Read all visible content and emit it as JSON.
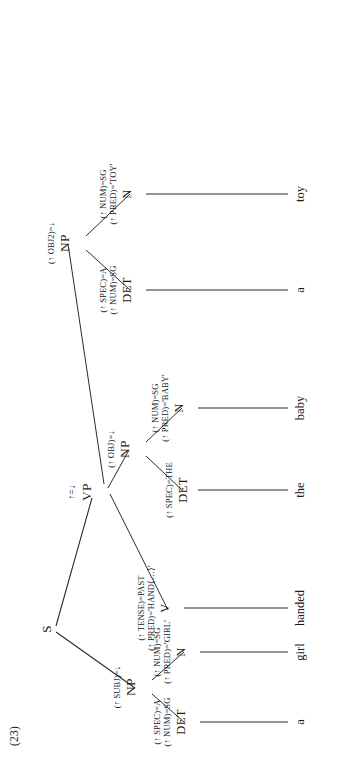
{
  "figure": {
    "example_number": "(23)",
    "type": "lfg-c-structure-tree",
    "sentence": "a girl handed the baby a toy",
    "orientation": "rotated-90-ccw"
  },
  "tree": {
    "root": {
      "id": "S",
      "category": "S",
      "annotation": []
    },
    "nodes": [
      {
        "id": "S",
        "category": "S",
        "annotation_lines": []
      },
      {
        "id": "NP-subj",
        "category": "NP",
        "annotation_lines": [
          "(↑ SUBJ)=↓"
        ]
      },
      {
        "id": "DET-a1",
        "category": "DET",
        "annotation_lines": [
          "(↑ SPEC)=A",
          "(↑ NUM)=SG"
        ]
      },
      {
        "id": "N-girl",
        "category": "N",
        "annotation_lines": [
          "(↑ NUM)=SG",
          "(↑ PRED)='GIRL'"
        ]
      },
      {
        "id": "VP",
        "category": "VP",
        "annotation_lines": [
          "↑=↓"
        ]
      },
      {
        "id": "V-handed",
        "category": "V",
        "annotation_lines": [
          "(↑ TENSE)=PAST",
          "(↑ PRED)='HAND⟨…⟩'"
        ]
      },
      {
        "id": "NP-obj",
        "category": "NP",
        "annotation_lines": [
          "(↑ OBJ)=↓"
        ]
      },
      {
        "id": "DET-the",
        "category": "DET",
        "annotation_lines": [
          "(↑ SPEC)=THE"
        ]
      },
      {
        "id": "N-baby",
        "category": "N",
        "annotation_lines": [
          "(↑ NUM)=SG",
          "(↑ PRED)='BABY'"
        ]
      },
      {
        "id": "NP-obj2",
        "category": "NP",
        "annotation_lines": [
          "(↑ OBJ2)=↓"
        ]
      },
      {
        "id": "DET-a2",
        "category": "DET",
        "annotation_lines": [
          "(↑ SPEC)=A",
          "(↑ NUM)=SG"
        ]
      },
      {
        "id": "N-toy",
        "category": "N",
        "annotation_lines": [
          "(↑ NUM)=SG",
          "(↑ PRED)='TOY'"
        ]
      }
    ],
    "leaves": [
      {
        "id": "leaf-a1",
        "word": "a"
      },
      {
        "id": "leaf-girl",
        "word": "girl"
      },
      {
        "id": "leaf-handed",
        "word": "handed"
      },
      {
        "id": "leaf-the",
        "word": "the"
      },
      {
        "id": "leaf-baby",
        "word": "baby"
      },
      {
        "id": "leaf-a2",
        "word": "a"
      },
      {
        "id": "leaf-toy",
        "word": "toy"
      }
    ]
  },
  "labels": {
    "S": "S",
    "NP": "NP",
    "VP": "VP",
    "V": "V",
    "N": "N",
    "DET": "DET",
    "subj_eq": "(↑ SUBJ)=↓",
    "obj_eq": "(↑ OBJ)=↓",
    "obj2_eq": "(↑ OBJ2)=↓",
    "head_eq": "↑=↓",
    "spec_a": "(↑ SPEC)=A",
    "spec_the": "(↑ SPEC)=THE",
    "num_sg": "(↑ NUM)=SG",
    "pred_girl": "(↑ PRED)='GIRL'",
    "pred_baby": "(↑ PRED)='BABY'",
    "pred_toy": "(↑ PRED)='TOY'",
    "pred_hand": "(↑ PRED)='HAND⟨…⟩'",
    "tense_past": "(↑ TENSE)=PAST"
  },
  "words": {
    "a1": "a",
    "girl": "girl",
    "handed": "handed",
    "the": "the",
    "baby": "baby",
    "a2": "a",
    "toy": "toy"
  },
  "colors": {
    "ink": "#1a1a1a",
    "line": "#2b2b2b",
    "paper": "#ffffff"
  }
}
